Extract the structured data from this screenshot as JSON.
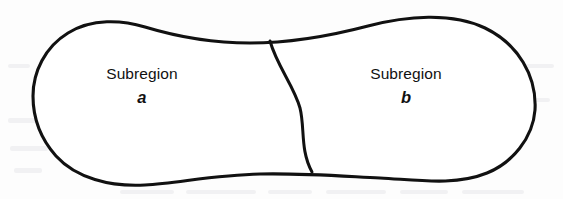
{
  "figure": {
    "type": "region-partition-diagram",
    "background_color": "#fdfdfd",
    "ink_color": "#111111",
    "fill_color": "#ffffff",
    "width": 563,
    "height": 199,
    "labels": {
      "left": {
        "word": "Subregion",
        "symbol": "a"
      },
      "right": {
        "word": "Subregion",
        "symbol": "b"
      }
    },
    "shapes": {
      "outline_name": "closed-region-boundary",
      "divider_name": "subregion-dividing-curve",
      "outline_path": "M 33 96 C 33 72 45 47 68 33 C 92 18 122 20 145 27 C 178 37 212 43 250 43 C 288 43 330 36 368 26 C 406 16 452 12 485 28 C 518 44 537 76 535 110 C 533 138 512 163 487 173 C 455 186 418 180 380 178 C 340 176 300 173 260 174 C 215 175 178 183 145 185 C 110 187 76 178 56 156 C 40 138 33 118 33 96 Z",
      "divider_path": "M 270 41 C 277 66 294 86 300 108 C 305 128 300 150 312 172"
    }
  }
}
